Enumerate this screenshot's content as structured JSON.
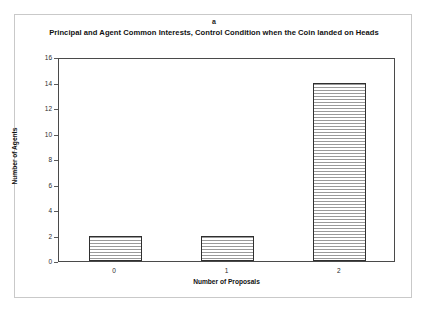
{
  "figure": {
    "panel_label": "a",
    "title": "Principal and Agent Common Interests, Control Condition when the Coin landed on Heads"
  },
  "chart_data": {
    "type": "bar",
    "title": "Principal and Agent Common Interests, Control Condition when the Coin landed on Heads",
    "panel": "a",
    "categories": [
      "0",
      "1",
      "2"
    ],
    "values": [
      2,
      2,
      14
    ],
    "xlabel": "Number of Proposals",
    "ylabel": "Number of Agents",
    "ylim": [
      0,
      16
    ],
    "yticks": [
      0,
      2,
      4,
      6,
      8,
      10,
      12,
      14,
      16
    ],
    "ytick_labels": [
      "0",
      "2",
      "4",
      "6",
      "8",
      "10",
      "12",
      "14",
      "16"
    ],
    "grid": false,
    "legend": null,
    "bar_fill": "horizontal-hatch",
    "bar_edge_color": "#2f2f2f",
    "bar_hatch_color": "#9a9a9a",
    "plot_background": "#ffffff",
    "axis_color": "#4a4a4a"
  }
}
